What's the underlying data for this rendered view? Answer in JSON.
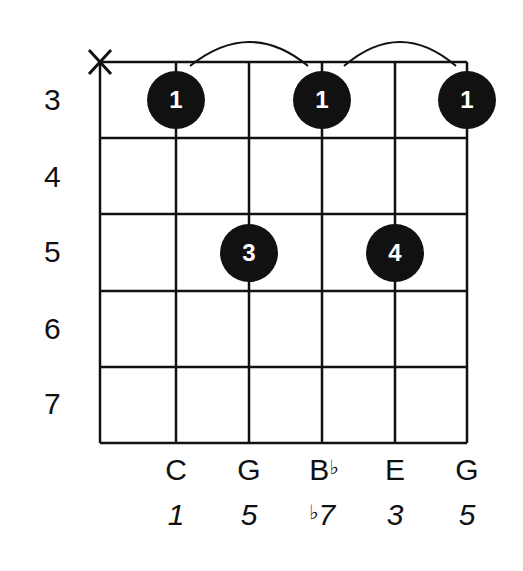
{
  "chord_diagram": {
    "instrument": "guitar",
    "strings_muted": [
      "string-6"
    ],
    "muted_symbol": "X",
    "fret_labels": [
      "3",
      "4",
      "5",
      "6",
      "7"
    ],
    "dots": [
      {
        "string": 5,
        "fret": 3,
        "finger": "1"
      },
      {
        "string": 3,
        "fret": 3,
        "finger": "1"
      },
      {
        "string": 1,
        "fret": 3,
        "finger": "1"
      },
      {
        "string": 4,
        "fret": 5,
        "finger": "3"
      },
      {
        "string": 2,
        "fret": 5,
        "finger": "4"
      }
    ],
    "barre_arcs": [
      {
        "from_string": 5,
        "to_string": 3,
        "fret": 3
      },
      {
        "from_string": 3,
        "to_string": 1,
        "fret": 3
      }
    ],
    "notes": [
      {
        "name": "C",
        "flat": ""
      },
      {
        "name": "G",
        "flat": ""
      },
      {
        "name": "B",
        "flat": "♭"
      },
      {
        "name": "E",
        "flat": ""
      },
      {
        "name": "G",
        "flat": ""
      }
    ],
    "intervals": [
      {
        "flat": "",
        "degree": "1"
      },
      {
        "flat": "",
        "degree": "5"
      },
      {
        "flat": "♭",
        "degree": "7"
      },
      {
        "flat": "",
        "degree": "3"
      },
      {
        "flat": "",
        "degree": "5"
      }
    ],
    "colors": {
      "ink": "#111111",
      "background": "#ffffff",
      "dot_text": "#ffffff"
    }
  }
}
